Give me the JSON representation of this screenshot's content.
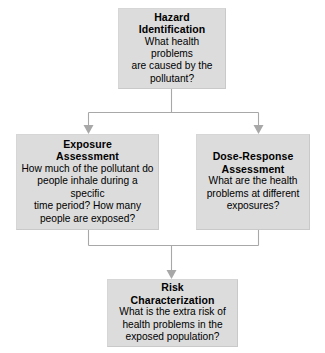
{
  "diagram": {
    "background_color": "#ffffff",
    "node_fill_color": "#dcdcdc",
    "node_border_color": "#c9c9c9",
    "connector_color": "#a8a8a8",
    "text_color": "#000000",
    "nodes": [
      {
        "id": "hazard-identification",
        "title_line1": "Hazard",
        "title_line2": "Identification",
        "body_line1": "What health problems",
        "body_line2": "are caused by the",
        "body_line3": "pollutant?"
      },
      {
        "id": "exposure-assessment",
        "title_line1": "Exposure",
        "title_line2": "Assessment",
        "body_line1": "How much of the pollutant do",
        "body_line2": "people inhale during a specific",
        "body_line3": "time period? How many",
        "body_line4": "people are exposed?"
      },
      {
        "id": "dose-response-assessment",
        "title_line1": "Dose-Response",
        "title_line2": "Assessment",
        "body_line1": "What are the health",
        "body_line2": "problems at different",
        "body_line3": "exposures?"
      },
      {
        "id": "risk-characterization",
        "title_line1": "Risk",
        "title_line2": "Characterization",
        "body_line1": "What is the extra risk of",
        "body_line2": "health problems in the",
        "body_line3": "exposed population?"
      }
    ],
    "edges": [
      {
        "id": "hazard-to-exposure",
        "from": "hazard-identification",
        "to": "exposure-assessment"
      },
      {
        "id": "hazard-to-dose",
        "from": "hazard-identification",
        "to": "dose-response-assessment"
      },
      {
        "id": "exposure-to-risk",
        "from": "exposure-assessment",
        "to": "risk-characterization"
      },
      {
        "id": "dose-to-risk",
        "from": "dose-response-assessment",
        "to": "risk-characterization"
      }
    ]
  }
}
